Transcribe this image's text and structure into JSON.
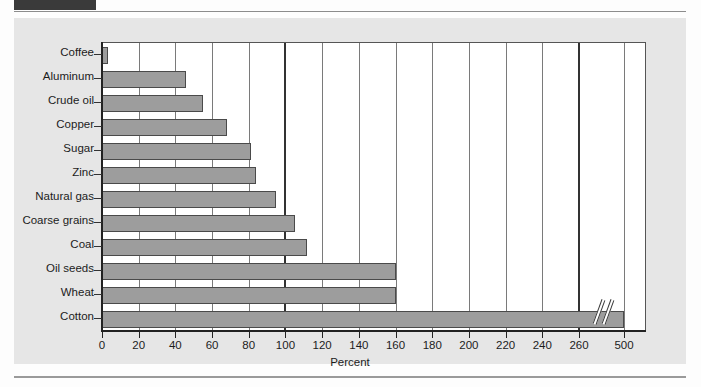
{
  "figure": {
    "tab_label": "",
    "title": "",
    "caption_bleed_1": "",
    "caption_bleed_2": "",
    "caption_bleed_3": ""
  },
  "chart_data": {
    "type": "bar",
    "orientation": "horizontal",
    "title": "",
    "xlabel": "Percent",
    "ylabel": "",
    "categories": [
      "Coffee",
      "Aluminum",
      "Crude oil",
      "Copper",
      "Sugar",
      "Zinc",
      "Natural gas",
      "Coarse grains",
      "Coal",
      "Oil seeds",
      "Wheat",
      "Cotton"
    ],
    "values": [
      3,
      46,
      55,
      68,
      81,
      84,
      95,
      105,
      112,
      160,
      160,
      500
    ],
    "xlim": [
      0,
      500
    ],
    "xticks": [
      0,
      20,
      40,
      60,
      80,
      100,
      120,
      140,
      160,
      180,
      200,
      220,
      240,
      260,
      500
    ],
    "xtick_labels": [
      "0",
      "20",
      "40",
      "60",
      "80",
      "100",
      "120",
      "140",
      "160",
      "180",
      "200",
      "220",
      "240",
      "260",
      "500"
    ],
    "axis_break": {
      "present": true,
      "after_value": 260,
      "before_value": 500
    },
    "emphasized_gridlines": [
      100,
      260
    ],
    "grid": true,
    "legend": null,
    "colors": {
      "bar_fill": "#9d9d9d",
      "bar_stroke": "#4a4a4a",
      "plot_background": "#ffffff",
      "panel_background": "#e6e6e6",
      "axis": "#222222",
      "gridline": "#7a7a7a",
      "text": "#1c1c1c"
    }
  }
}
